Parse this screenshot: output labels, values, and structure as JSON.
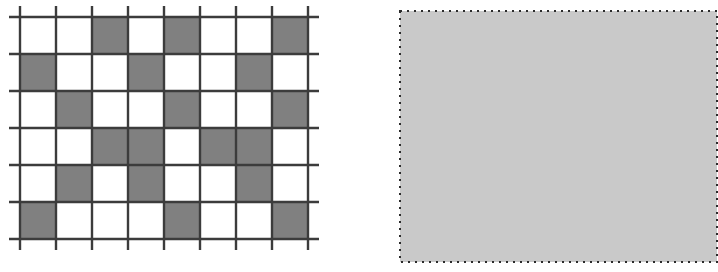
{
  "figure": {
    "kind": "two-panel-figure",
    "background_color": "#ffffff",
    "panels": [
      {
        "id": "left",
        "name": "checkered-grid-panel"
      },
      {
        "id": "right",
        "name": "shaded-rectangle-panel"
      }
    ]
  },
  "grid_panel": {
    "name": "checkered-grid",
    "columns": 8,
    "rows": 6,
    "cell_width": 36,
    "cell_height": 37,
    "origin_x": 20,
    "origin_y": 17,
    "line_color": "#3c3c3c",
    "line_width": 2.4,
    "tick_overhang": 11,
    "filled_color": "#808080",
    "empty_color": "#ffffff",
    "filled_cells": [
      [
        1,
        3
      ],
      [
        1,
        5
      ],
      [
        1,
        8
      ],
      [
        2,
        1
      ],
      [
        2,
        4
      ],
      [
        2,
        7
      ],
      [
        3,
        2
      ],
      [
        3,
        5
      ],
      [
        3,
        8
      ],
      [
        4,
        3
      ],
      [
        4,
        4
      ],
      [
        4,
        6
      ],
      [
        4,
        7
      ],
      [
        5,
        2
      ],
      [
        5,
        4
      ],
      [
        5,
        7
      ],
      [
        6,
        1
      ],
      [
        6,
        5
      ],
      [
        6,
        8
      ]
    ],
    "occupancy_matrix": [
      [
        0,
        0,
        1,
        0,
        1,
        0,
        0,
        1
      ],
      [
        1,
        0,
        0,
        1,
        0,
        0,
        1,
        0
      ],
      [
        0,
        1,
        0,
        0,
        1,
        0,
        0,
        1
      ],
      [
        0,
        0,
        1,
        1,
        0,
        1,
        1,
        0
      ],
      [
        0,
        1,
        0,
        1,
        0,
        0,
        1,
        0
      ],
      [
        1,
        0,
        0,
        0,
        1,
        0,
        0,
        1
      ]
    ],
    "filled_count": 19,
    "total_cells": 48
  },
  "shaded_panel": {
    "name": "shaded-rectangle",
    "fill_color": "#c9c9c9",
    "border_style": "dotted",
    "border_color": "#2b2b2b",
    "border_width": 2,
    "dot_size": 2,
    "dot_gap": 5,
    "width": 317,
    "height": 251
  }
}
